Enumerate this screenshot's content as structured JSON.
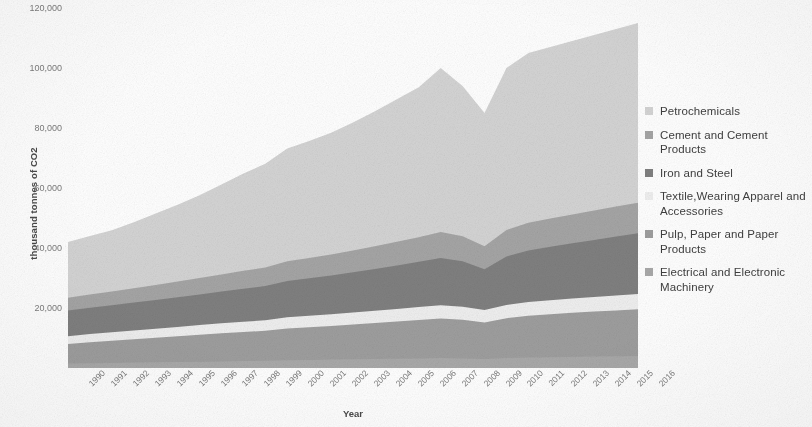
{
  "chart_data": {
    "type": "area",
    "stacked": true,
    "title": "",
    "xlabel": "Year",
    "ylabel": "thousand tonnes of CO2",
    "ylim": [
      0,
      120000
    ],
    "ytick_values": [
      0,
      20000,
      40000,
      60000,
      80000,
      100000,
      120000
    ],
    "ytick_labels": [
      "",
      "20,000",
      "40,000",
      "60,000",
      "80,000",
      "100,000",
      "120,000"
    ],
    "grid": false,
    "legend_position": "right",
    "categories": [
      "1990",
      "1991",
      "1992",
      "1993",
      "1994",
      "1995",
      "1996",
      "1997",
      "1998",
      "1999",
      "2000",
      "2001",
      "2002",
      "2003",
      "2004",
      "2005",
      "2006",
      "2007",
      "2008",
      "2009",
      "2010",
      "2011",
      "2012",
      "2013",
      "2014",
      "2015",
      "2016"
    ],
    "series": [
      {
        "name": "Electrical and Electronic Machinery",
        "color": "#a9a9a9",
        "values": [
          1500,
          1600,
          1700,
          1800,
          1900,
          2000,
          2100,
          2200,
          2300,
          2400,
          2600,
          2700,
          2800,
          2900,
          3000,
          3100,
          3200,
          3300,
          3200,
          3000,
          3300,
          3500,
          3600,
          3700,
          3800,
          3900,
          4000
        ]
      },
      {
        "name": "Pulp, Paper and Paper Products",
        "color": "#9e9e9e",
        "values": [
          6500,
          7000,
          7400,
          7800,
          8200,
          8600,
          9000,
          9400,
          9700,
          10000,
          10600,
          10900,
          11200,
          11600,
          12000,
          12400,
          12800,
          13200,
          12900,
          12200,
          13300,
          13900,
          14300,
          14700,
          15000,
          15300,
          15600
        ]
      },
      {
        "name": "Textile, Wearing Apparel and Accessories",
        "color": "#efefef",
        "values": [
          2600,
          2700,
          2800,
          2900,
          3000,
          3100,
          3200,
          3300,
          3400,
          3500,
          3700,
          3800,
          3900,
          4000,
          4100,
          4200,
          4300,
          4400,
          4300,
          4100,
          4400,
          4600,
          4700,
          4800,
          4900,
          5000,
          5100
        ]
      },
      {
        "name": "Iron and Steel",
        "color": "#808080",
        "values": [
          8600,
          8800,
          9000,
          9300,
          9600,
          9900,
          10200,
          10600,
          11000,
          11400,
          12100,
          12500,
          12900,
          13400,
          13900,
          14500,
          15100,
          15800,
          15200,
          13600,
          16200,
          17200,
          17800,
          18400,
          19000,
          19600,
          20200
        ]
      },
      {
        "name": "Cement and Cement Products",
        "color": "#a5a5a5",
        "values": [
          4200,
          4400,
          4600,
          4800,
          5000,
          5200,
          5500,
          5700,
          6000,
          6200,
          6600,
          6800,
          7000,
          7300,
          7600,
          7900,
          8200,
          8600,
          8300,
          7700,
          8800,
          9200,
          9400,
          9600,
          9800,
          10000,
          10200
        ]
      },
      {
        "name": "Petrochemicals",
        "color": "#d4d4d4",
        "values": [
          18600,
          19500,
          20400,
          22000,
          23800,
          25600,
          27600,
          30000,
          32400,
          34600,
          37600,
          39000,
          40600,
          42600,
          45000,
          47500,
          50000,
          54700,
          50100,
          44400,
          54000,
          56600,
          57200,
          57800,
          58500,
          59200,
          59900
        ]
      }
    ],
    "legend_entries": [
      {
        "label": "Petrochemicals",
        "color": "#d4d4d4"
      },
      {
        "label": "Cement and Cement Products",
        "color": "#a5a5a5"
      },
      {
        "label": "Iron and Steel",
        "color": "#808080"
      },
      {
        "label": "Textile,Wearing Apparel and Accessories",
        "color": "#efefef"
      },
      {
        "label": "Pulp, Paper and Paper Products",
        "color": "#9e9e9e"
      },
      {
        "label": "Electrical and Electronic Machinery",
        "color": "#a9a9a9"
      }
    ]
  }
}
